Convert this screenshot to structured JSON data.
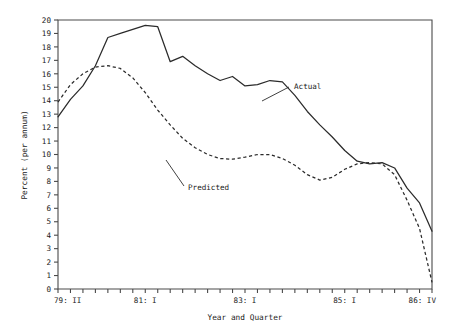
{
  "chart_data": {
    "type": "line",
    "title": "",
    "xlabel": "Year and Quarter",
    "ylabel": "Percent (per annum)",
    "ylim": [
      0,
      20
    ],
    "grid": false,
    "legend_position": "inline-annotations",
    "y_ticks": [
      "0",
      "1",
      "2",
      "3",
      "4",
      "5",
      "6",
      "7",
      "8",
      "9",
      "10",
      "11",
      "12",
      "13",
      "14",
      "15",
      "16",
      "17",
      "18",
      "19",
      "20"
    ],
    "x_tick_labels": [
      "79: II",
      "81: I",
      "83: I",
      "85: I",
      "86: IV"
    ],
    "x_tick_label_indices": [
      0,
      7,
      15,
      23,
      30
    ],
    "x_quarters": [
      "79: II",
      "79: III",
      "79: IV",
      "80: I",
      "80: II",
      "80: III",
      "80: IV",
      "81: I",
      "81: II",
      "81: III",
      "81: IV",
      "82: I",
      "82: II",
      "82: III",
      "82: IV",
      "83: I",
      "83: II",
      "83: III",
      "83: IV",
      "84: I",
      "84: II",
      "84: III",
      "84: IV",
      "85: I",
      "85: II",
      "85: III",
      "85: IV",
      "86: I",
      "86: II",
      "86: III",
      "86: IV"
    ],
    "n_points": 31,
    "series": [
      {
        "name": "Actual",
        "style": "solid",
        "color": "#2b2b2b",
        "values": [
          12.8,
          14.1,
          15.1,
          16.6,
          18.7,
          19.0,
          19.3,
          19.6,
          19.5,
          16.9,
          17.3,
          16.6,
          16.0,
          15.5,
          15.8,
          15.1,
          15.2,
          15.5,
          15.4,
          14.4,
          13.2,
          12.2,
          11.3,
          10.3,
          9.5,
          9.3,
          9.4,
          9.0,
          7.5,
          6.4,
          4.3
        ]
      },
      {
        "name": "Predicted",
        "style": "dashed",
        "color": "#2b2b2b",
        "values": [
          13.9,
          15.2,
          16.0,
          16.5,
          16.6,
          16.4,
          15.7,
          14.6,
          13.3,
          12.2,
          11.2,
          10.5,
          10.0,
          9.7,
          9.65,
          9.8,
          10.0,
          10.0,
          9.7,
          9.2,
          8.5,
          8.1,
          8.3,
          8.9,
          9.3,
          9.4,
          9.3,
          8.5,
          6.6,
          4.5,
          0.5
        ]
      }
    ],
    "annotations": [
      {
        "name": "Actual",
        "text": "Actual",
        "x": 294,
        "y": 89,
        "leader_from": [
          289,
          87
        ],
        "leader_to": [
          262,
          101
        ]
      },
      {
        "name": "Predicted",
        "text": "Predicted",
        "x": 188,
        "y": 190,
        "leader_from": [
          184,
          186
        ],
        "leader_to": [
          166,
          160
        ]
      }
    ]
  }
}
